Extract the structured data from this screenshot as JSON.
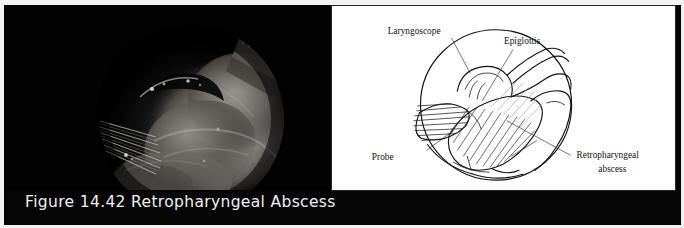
{
  "figure": {
    "caption": "Figure 14.42  Retropharyngeal Abscess",
    "caption_number": "14.42",
    "caption_title": "Retropharyngeal Abscess",
    "background_color": "#050505",
    "caption_color": "#f0efee"
  },
  "photo": {
    "kind": "endoscopic-photograph",
    "description": "Dark endoscopic view of the hypopharynx showing a bulging retropharyngeal abscess with a ridged laryngoscope blade at left",
    "panel_color": "#040404"
  },
  "diagram": {
    "kind": "line-drawing",
    "panel_color": "#ffffff",
    "border_color": "#2a2a2a",
    "labels": [
      {
        "id": "laryngoscope",
        "text": "Laryngoscope"
      },
      {
        "id": "epiglottis",
        "text": "Epiglottis"
      },
      {
        "id": "probe",
        "text": "Probe"
      },
      {
        "id": "abscess_line1",
        "text": "Retropharyngeal"
      },
      {
        "id": "abscess_line2",
        "text": "abscess"
      }
    ]
  }
}
